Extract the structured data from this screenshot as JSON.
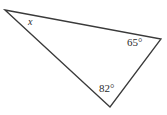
{
  "figure": {
    "type": "triangle-angle-diagram",
    "background_color": "#ffffff",
    "stroke_color": "#3a3a3a",
    "text_color": "#2b2b2b",
    "stroke_width": 1.3,
    "width": 167,
    "height": 115
  },
  "chart_data": {
    "type": "diagram",
    "title": "",
    "shape": "triangle",
    "vertices": [
      {
        "name": "A",
        "x": 5,
        "y": 10
      },
      {
        "name": "B",
        "x": 161,
        "y": 39
      },
      {
        "name": "C",
        "x": 110,
        "y": 107
      }
    ],
    "edges": [
      {
        "from": "A",
        "to": "B"
      },
      {
        "from": "B",
        "to": "C"
      },
      {
        "from": "C",
        "to": "A"
      }
    ],
    "angle_labels": [
      {
        "vertex": "A",
        "text": "x",
        "italic": true,
        "value": null,
        "unit": ""
      },
      {
        "vertex": "B",
        "text": "65°",
        "italic": false,
        "value": 65,
        "unit": "degrees"
      },
      {
        "vertex": "C",
        "text": "82°",
        "italic": false,
        "value": 82,
        "unit": "degrees"
      }
    ]
  },
  "labels": {
    "unknown_angle": "x",
    "angle_right": "65°",
    "angle_bottom": "82°"
  }
}
